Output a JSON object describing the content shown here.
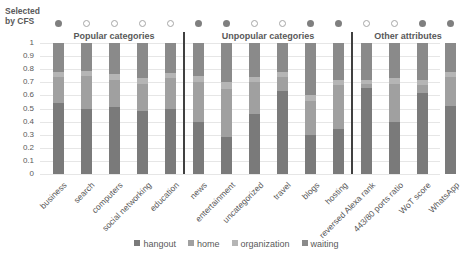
{
  "chart_data": {
    "type": "bar",
    "stacked": true,
    "title": "",
    "xlabel": "",
    "ylabel": "",
    "ylim": [
      0,
      1
    ],
    "yticks": [
      "0",
      "0.1",
      "0.2",
      "0.3",
      "0.4",
      "0.5",
      "0.6",
      "0.7",
      "0.8",
      "0.9",
      "1"
    ],
    "grid": true,
    "legend_position": "bottom",
    "categories": [
      "business",
      "search",
      "computers",
      "social networking",
      "education",
      "news",
      "entertainment",
      "uncategorized",
      "travel",
      "blogs",
      "hosting",
      "reversed Alexa rank",
      "443/80 ports ratio",
      "WoT score",
      "WhatsApp"
    ],
    "series": [
      {
        "name": "hangout",
        "color": "#7a7a7a",
        "values": [
          0.54,
          0.5,
          0.51,
          0.48,
          0.5,
          0.4,
          0.28,
          0.46,
          0.63,
          0.3,
          0.34,
          0.66,
          0.4,
          0.62,
          0.52
        ]
      },
      {
        "name": "home",
        "color": "#a0a0a0",
        "values": [
          0.2,
          0.25,
          0.21,
          0.21,
          0.23,
          0.3,
          0.37,
          0.24,
          0.11,
          0.26,
          0.34,
          0.03,
          0.29,
          0.06,
          0.22
        ]
      },
      {
        "name": "organization",
        "color": "#b5b5b5",
        "values": [
          0.04,
          0.04,
          0.04,
          0.04,
          0.04,
          0.05,
          0.05,
          0.04,
          0.04,
          0.04,
          0.04,
          0.03,
          0.04,
          0.04,
          0.04
        ]
      },
      {
        "name": "waiting",
        "color": "#8a8a8a",
        "values": [
          0.22,
          0.21,
          0.24,
          0.27,
          0.23,
          0.25,
          0.3,
          0.26,
          0.22,
          0.4,
          0.28,
          0.28,
          0.27,
          0.28,
          0.22
        ]
      }
    ],
    "selected_by_cfs": [
      true,
      false,
      false,
      false,
      false,
      true,
      true,
      false,
      false,
      true,
      true,
      false,
      false,
      true,
      true
    ],
    "groups": [
      {
        "label": "Popular categories",
        "range": [
          0,
          4
        ]
      },
      {
        "label": "Unpopular categories",
        "range": [
          5,
          10
        ]
      },
      {
        "label": "Other attributes",
        "range": [
          11,
          14
        ]
      }
    ]
  },
  "labels": {
    "cfs": "Selected by CFS"
  }
}
